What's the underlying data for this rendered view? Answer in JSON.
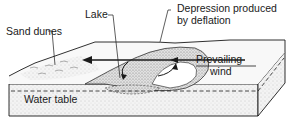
{
  "diagram": {
    "labels": {
      "lake": "Lake",
      "depression_line1": "Depression produced",
      "depression_line2": "by deflation",
      "sand_dunes": "Sand dunes",
      "prevailing": "Prevailing",
      "wind": "wind",
      "water_table": "Water table"
    },
    "colors": {
      "ink": "#1a1a1a",
      "stipple_fill": "#ececec",
      "dark_stipple": "#cfcfcf",
      "background": "#ffffff"
    }
  }
}
